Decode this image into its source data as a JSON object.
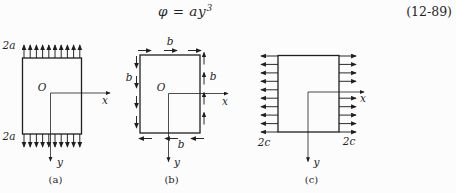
{
  "equation": {
    "body": "φ = ay",
    "exponent": "3",
    "number": "(12-89)"
  },
  "colors": {
    "ink": "#1f1f1f",
    "background": "#fcfcfc"
  },
  "diagrams": {
    "a": {
      "caption": "(a)",
      "top_load_label": "2a",
      "bottom_load_label": "2a",
      "origin_label": "O",
      "x_axis_label": "x",
      "y_axis_label": "y"
    },
    "b": {
      "caption": "(b)",
      "top_shear_label": "b",
      "bottom_shear_label": "b",
      "left_shear_label": "b",
      "right_shear_label": "b",
      "origin_label": "O",
      "x_axis_label": "x",
      "y_axis_label": "y"
    },
    "c": {
      "caption": "(c)",
      "left_load_label": "2c",
      "right_load_label": "2c",
      "x_axis_label": "x",
      "y_axis_label": "y"
    }
  }
}
